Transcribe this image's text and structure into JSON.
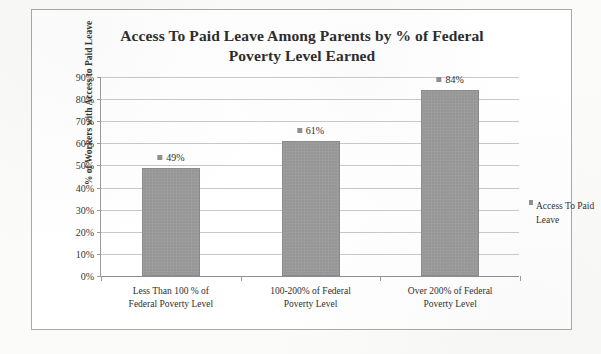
{
  "chart_data": {
    "type": "bar",
    "title": "Access To Paid Leave Among Parents by % of Federal Poverty Level Earned",
    "title_line1": "Access To Paid Leave Among Parents by % of Federal",
    "title_line2": "Poverty Level Earned",
    "xlabel": "",
    "ylabel": "% of Workers with Access to Paid Leave",
    "ylim": [
      0,
      90
    ],
    "ytick_labels": [
      "90%",
      "80%",
      "70%",
      "60%",
      "50%",
      "40%",
      "30%",
      "20%",
      "10%",
      "0%"
    ],
    "ytick_values": [
      90,
      80,
      70,
      60,
      50,
      40,
      30,
      20,
      10,
      0
    ],
    "grid": true,
    "legend_position": "right",
    "categories": [
      "Less Than 100 % of Federal Poverty Level",
      "100-200% of Federal Poverty Level",
      "Over 200% of Federal Poverty Level"
    ],
    "category_lines": [
      [
        "Less Than 100 % of",
        "Federal Poverty Level"
      ],
      [
        "100-200% of Federal",
        "Poverty Level"
      ],
      [
        "Over 200% of Federal",
        "Poverty Level"
      ]
    ],
    "values": [
      49,
      61,
      84
    ],
    "data_labels": [
      "49%",
      "61%",
      "84%"
    ],
    "series": [
      {
        "name": "Access To Paid Leave",
        "values": [
          49,
          61,
          84
        ]
      }
    ],
    "legend": [
      {
        "label": "Access To Paid Leave",
        "color": "#969696"
      }
    ],
    "bar_color": "#969696"
  }
}
